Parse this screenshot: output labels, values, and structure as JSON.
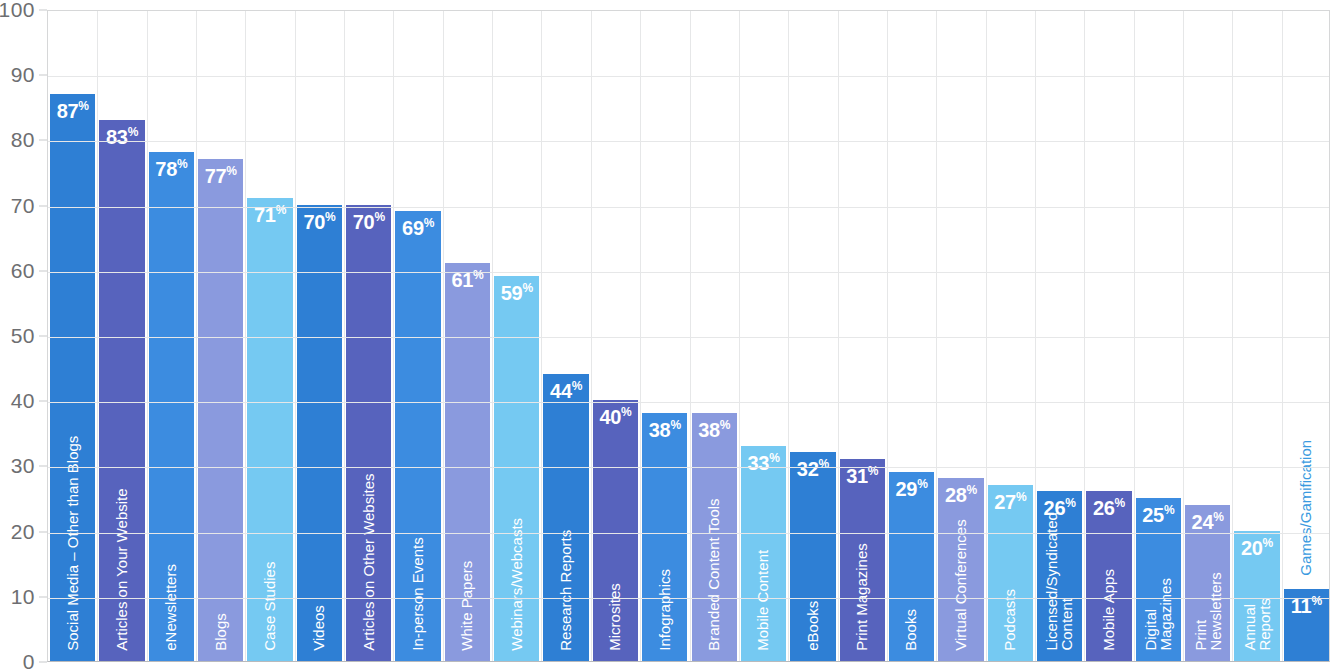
{
  "chart_data": {
    "type": "bar",
    "title": "",
    "subtitle": "",
    "xlabel": "",
    "ylabel": "",
    "ylim": [
      0,
      100
    ],
    "ytick_labels": [
      "100",
      "90",
      "80",
      "70",
      "60",
      "50",
      "40",
      "30",
      "20",
      "10",
      "0"
    ],
    "ytick_values": [
      100,
      90,
      80,
      70,
      60,
      50,
      40,
      30,
      20,
      10,
      0
    ],
    "grid": true,
    "legend": "none",
    "value_suffix": "%",
    "categories": [
      "Social Media – Other than Blogs",
      "Articles on Your Website",
      "eNewsletters",
      "Blogs",
      "Case Studies",
      "Videos",
      "Articles on Other Websites",
      "In-person Events",
      "White Papers",
      "Webinars/Webcasts",
      "Research Reports",
      "Microsites",
      "Infographics",
      "Branded Content Tools",
      "Mobile Content",
      "eBooks",
      "Print Magazines",
      "Books",
      "Virtual Conferences",
      "Podcasts",
      "Licensed/Syndicated Content",
      "Mobile Apps",
      "Digital Magazines",
      "Print Newsletters",
      "Annual Reports",
      "Games/Gamification"
    ],
    "values": [
      87,
      83,
      78,
      77,
      71,
      70,
      70,
      69,
      61,
      59,
      44,
      40,
      38,
      38,
      33,
      32,
      31,
      29,
      28,
      27,
      26,
      26,
      25,
      24,
      20,
      11
    ],
    "bar_colors": [
      "#2e7fd4",
      "#5763bd",
      "#3c8ce0",
      "#8a9ade",
      "#75c9f2",
      "#2e7fd4",
      "#5763bd",
      "#3c8ce0",
      "#8a9ade",
      "#75c9f2",
      "#2e7fd4",
      "#5763bd",
      "#3c8ce0",
      "#8a9ade",
      "#75c9f2",
      "#2e7fd4",
      "#5763bd",
      "#3c8ce0",
      "#8a9ade",
      "#75c9f2",
      "#2e7fd4",
      "#5763bd",
      "#3c8ce0",
      "#8a9ade",
      "#75c9f2",
      "#2e7fd4"
    ],
    "label_lines": [
      [
        "Social Media – Other than Blogs"
      ],
      [
        "Articles on Your Website"
      ],
      [
        "eNewsletters"
      ],
      [
        "Blogs"
      ],
      [
        "Case Studies"
      ],
      [
        "Videos"
      ],
      [
        "Articles on Other Websites"
      ],
      [
        "In-person Events"
      ],
      [
        "White Papers"
      ],
      [
        "Webinars/Webcasts"
      ],
      [
        "Research Reports"
      ],
      [
        "Microsites"
      ],
      [
        "Infographics"
      ],
      [
        "Branded Content Tools"
      ],
      [
        "Mobile Content"
      ],
      [
        "eBooks"
      ],
      [
        "Print Magazines"
      ],
      [
        "Books"
      ],
      [
        "Virtual Conferences"
      ],
      [
        "Podcasts"
      ],
      [
        "Licensed/Syndicated",
        "Content"
      ],
      [
        "Mobile Apps"
      ],
      [
        "Digital",
        "Magazines"
      ],
      [
        "Print",
        "Newsletters"
      ],
      [
        "Annual",
        "Reports"
      ],
      [
        "Games/Gamification"
      ]
    ],
    "label_placement": [
      "inside",
      "inside",
      "inside",
      "inside",
      "inside",
      "inside",
      "inside",
      "inside",
      "inside",
      "inside",
      "inside",
      "inside",
      "inside",
      "inside",
      "inside",
      "inside",
      "inside",
      "inside",
      "inside",
      "inside",
      "inside",
      "inside",
      "inside",
      "inside",
      "inside",
      "outside"
    ]
  },
  "style": {
    "gridline_color": "#e6e7e8",
    "axis_text_color": "#6d6e71",
    "value_text_color": "#ffffff",
    "outside_label_color": "#3a9ae0",
    "background": "#ffffff"
  }
}
